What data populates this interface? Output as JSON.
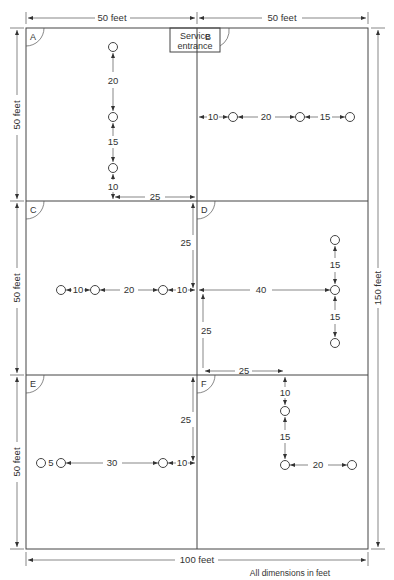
{
  "diagram": {
    "type": "floor-plan-sprinkler-layout",
    "overall": {
      "width_label": "100 feet",
      "height_label": "150 feet",
      "top_left_label": "50 feet",
      "top_right_label": "50 feet",
      "left_labels": [
        "50 feet",
        "50 feet",
        "50 feet"
      ]
    },
    "service_entrance": {
      "line1": "Service",
      "line2": "entrance"
    },
    "rooms": [
      {
        "id": "A",
        "label": "A"
      },
      {
        "id": "B",
        "label": "B"
      },
      {
        "id": "C",
        "label": "C"
      },
      {
        "id": "D",
        "label": "D"
      },
      {
        "id": "E",
        "label": "E"
      },
      {
        "id": "F",
        "label": "F"
      }
    ],
    "dimensions": {
      "A": {
        "top": "20",
        "mid": "15",
        "bottom": "10",
        "to_wall": "25"
      },
      "B": {
        "first": "10",
        "second": "20",
        "third": "15"
      },
      "C": {
        "first": "10",
        "second": "20",
        "third": "10",
        "vertical": "25"
      },
      "D": {
        "horizontal": "40",
        "upper": "15",
        "lower": "15",
        "down": "25",
        "right": "25"
      },
      "E": {
        "first": "5",
        "second": "30",
        "third": "10",
        "vertical": "25"
      },
      "F": {
        "top": "10",
        "mid": "15",
        "right": "20"
      }
    },
    "footnote": "All dimensions in feet"
  }
}
